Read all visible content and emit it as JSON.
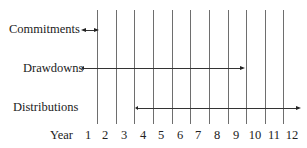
{
  "diagram": {
    "rows": [
      {
        "label": "Commitments",
        "start_year": 1,
        "end_year": 1,
        "direction": "both"
      },
      {
        "label": "Drawdowns",
        "start_year": 1,
        "end_year": 9,
        "direction": "right"
      },
      {
        "label": "Distributions",
        "start_year": 4,
        "end_year": 12,
        "direction": "both"
      }
    ],
    "axis": {
      "label": "Year",
      "ticks": [
        "1",
        "2",
        "3",
        "4",
        "5",
        "6",
        "7",
        "8",
        "9",
        "10",
        "11",
        "12"
      ]
    }
  }
}
